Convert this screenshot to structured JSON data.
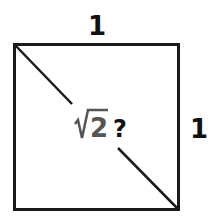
{
  "diagram": {
    "top_label": "1",
    "right_label": "1",
    "diagonal_label": {
      "radical": "√",
      "radicand": "2",
      "question": "?"
    },
    "colors": {
      "stroke": "#1a1a1a",
      "radical_text": "#555555",
      "question_text": "#111111",
      "background": "#ffffff"
    }
  }
}
